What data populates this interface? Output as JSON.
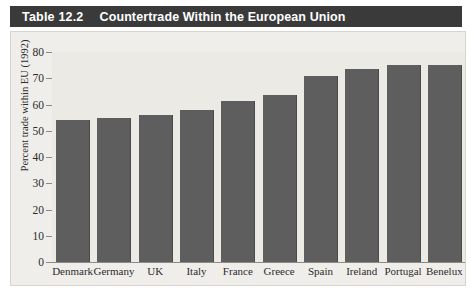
{
  "title": {
    "number": "Table 12.2",
    "text": "Countertrade Within the European Union"
  },
  "colors": {
    "title_bar": "#3a3a3a",
    "title_text": "#ffffff",
    "bar_fill": "#5e5e5e",
    "panel_bg": "#f0eeea",
    "plot_bg": "#eceae5",
    "axis": "#8e8a84"
  },
  "chart_data": {
    "type": "bar",
    "title": "Countertrade Within the European Union",
    "xlabel": "",
    "ylabel": "Percent trade within EU (1992)",
    "ylim": [
      0,
      80
    ],
    "yticks": [
      0,
      10,
      20,
      30,
      40,
      50,
      60,
      70,
      80
    ],
    "grid": false,
    "legend": "none",
    "categories": [
      "Denmark",
      "Germany",
      "UK",
      "Italy",
      "France",
      "Greece",
      "Spain",
      "Ireland",
      "Portugal",
      "Benelux"
    ],
    "values": [
      54,
      55,
      56,
      58,
      61.5,
      63.5,
      71,
      73.5,
      75,
      75
    ]
  }
}
